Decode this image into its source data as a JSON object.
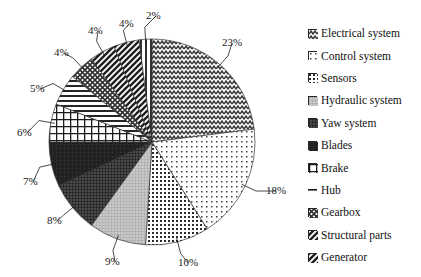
{
  "chart_data": {
    "type": "pie",
    "title": "",
    "subtitle": "",
    "xlabel": "",
    "ylabel": "",
    "legend_position": "right",
    "grid": false,
    "start_angle_deg": 0,
    "direction": "clockwise",
    "categories": [
      "Electrical system",
      "Control system",
      "Sensors",
      "Hydraulic system",
      "Yaw system",
      "Blades",
      "Brake",
      "Hub",
      "Gearbox",
      "Structural parts",
      "Generator"
    ],
    "values": [
      23,
      18,
      10,
      9,
      8,
      7,
      6,
      5,
      4,
      4,
      4
    ],
    "unlabeled_remainder": 2,
    "value_labels": [
      "23%",
      "18%",
      "10%",
      "9%",
      "8%",
      "7%",
      "6%",
      "5%",
      "4%",
      "4%",
      "4%",
      "2%"
    ],
    "slices": [
      {
        "label": "Electrical system",
        "value": 23,
        "display": "23%",
        "pattern": "zigzag"
      },
      {
        "label": "Control system",
        "value": 18,
        "display": "18%",
        "pattern": "sparse-dots"
      },
      {
        "label": "Sensors",
        "value": 10,
        "display": "10%",
        "pattern": "dense-dots"
      },
      {
        "label": "Hydraulic system",
        "value": 9,
        "display": "9%",
        "pattern": "fine-grid-light"
      },
      {
        "label": "Yaw system",
        "value": 8,
        "display": "8%",
        "pattern": "dark-grid"
      },
      {
        "label": "Blades",
        "value": 7,
        "display": "7%",
        "pattern": "solid-dark"
      },
      {
        "label": "Brake",
        "value": 6,
        "display": "6%",
        "pattern": "checker-grid"
      },
      {
        "label": "Hub",
        "value": 5,
        "display": "5%",
        "pattern": "horizontal-lines"
      },
      {
        "label": "Gearbox",
        "value": 4,
        "display": "4%",
        "pattern": "diagonal-crosshatch"
      },
      {
        "label": "Structural parts",
        "value": 4,
        "display": "4%",
        "pattern": "diagonal-up-stripes"
      },
      {
        "label": "Generator",
        "value": 4,
        "display": "4%",
        "pattern": "diagonal-down-stripes"
      },
      {
        "label": "",
        "value": 2,
        "display": "2%",
        "pattern": "vertical-stripes"
      }
    ]
  },
  "pie": {
    "labels": [
      {
        "text": "23%",
        "x": 222,
        "y": 37
      },
      {
        "text": "18%",
        "x": 266,
        "y": 185
      },
      {
        "text": "10%",
        "x": 178,
        "y": 257
      },
      {
        "text": "9%",
        "x": 105,
        "y": 256
      },
      {
        "text": "8%",
        "x": 47,
        "y": 215
      },
      {
        "text": "7%",
        "x": 23,
        "y": 176
      },
      {
        "text": "6%",
        "x": 17,
        "y": 127
      },
      {
        "text": "5%",
        "x": 30,
        "y": 83
      },
      {
        "text": "4%",
        "x": 54,
        "y": 47
      },
      {
        "text": "4%",
        "x": 88,
        "y": 25
      },
      {
        "text": "4%",
        "x": 119,
        "y": 18
      },
      {
        "text": "2%",
        "x": 146,
        "y": 10
      }
    ]
  },
  "legend": {
    "items": [
      {
        "label": "Electrical system",
        "swatch": "zigzag-swatch"
      },
      {
        "label": "Control system",
        "swatch": "sparse-dots-swatch"
      },
      {
        "label": "Sensors",
        "swatch": "dense-dots-swatch"
      },
      {
        "label": "Hydraulic system",
        "swatch": "fine-grid-swatch"
      },
      {
        "label": "Yaw system",
        "swatch": "dark-grid-swatch"
      },
      {
        "label": "Blades",
        "swatch": "solid-dark-swatch"
      },
      {
        "label": "Brake",
        "swatch": "checker-swatch"
      },
      {
        "label": "Hub",
        "swatch": "horizontal-lines-swatch"
      },
      {
        "label": "Gearbox",
        "swatch": "crosshatch-swatch"
      },
      {
        "label": "Structural parts",
        "swatch": "diagonal-up-swatch"
      },
      {
        "label": "Generator",
        "swatch": "diagonal-down-swatch"
      }
    ]
  },
  "colors": {
    "ink": "#1a1a1a",
    "background": "#ffffff",
    "outline": "#333333"
  }
}
